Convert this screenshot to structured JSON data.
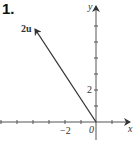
{
  "problem_number": "1.",
  "diagram": {
    "type": "vector-plot",
    "axes": {
      "x_label": "x",
      "y_label": "y"
    },
    "tick_labels": {
      "x": "−2",
      "y": "2",
      "origin": "0"
    },
    "vector": {
      "label": "2u",
      "tail": [
        0,
        0
      ],
      "head": [
        -4,
        6
      ]
    },
    "x_ticks": [
      -6,
      -5,
      -4,
      -3,
      -2,
      -1,
      1
    ],
    "y_ticks": [
      1,
      2,
      3,
      4,
      5,
      6
    ],
    "colors": {
      "ink": "#333333",
      "background": "#ffffff"
    }
  }
}
